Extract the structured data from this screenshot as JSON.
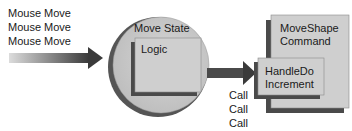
{
  "input_events": {
    "items": [
      "Mouse Move",
      "Mouse Move",
      "Mouse Move"
    ]
  },
  "state": {
    "title": "Move State",
    "logic_label": "Logic"
  },
  "calls": {
    "items": [
      "Call",
      "Call",
      "Call"
    ]
  },
  "command": {
    "title_line1": "MoveShape",
    "title_line2": "Command",
    "handler_line1": "HandleDo",
    "handler_line2": "Increment"
  },
  "colors": {
    "circle_fill": "#c9c9c9",
    "circle_shadow": "#555555",
    "box_fill": "#cfcfcf",
    "box_shadow": "#4a4a4a",
    "arrow_dark": "#3a3a3a",
    "arrow_light": "#d8d8d8"
  }
}
